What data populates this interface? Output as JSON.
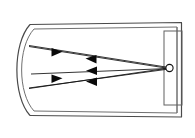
{
  "figure": {
    "title": "",
    "type": "optical-ray-diagram",
    "background_color": "#ffffff",
    "stroke_color": "#555555",
    "ray_color": "#111111",
    "width": 195,
    "height": 138
  },
  "housing": {
    "name": "lamp-housing-outline",
    "outer_path": "M 30 25 L 181 23 L 181 117 L 30 115 L 17 93 L 17 47 Z",
    "inner_path": "M 34 29 L 177 27 L 177 113 L 34 111 L 22 92 L 22 48 Z",
    "description": "Double-line rounded housing enclosure"
  },
  "mirror": {
    "name": "parabolic-reflector",
    "outer_arc": "M 30 25 C 13 45, 13 95, 30 115",
    "inner_arc": "M 34 29 C 18 47, 18 93, 34 111",
    "description": "Curved parabolic reflecting surface on the left"
  },
  "lamp_box": {
    "name": "lamp-socket-rectangle",
    "x": 164,
    "y": 31,
    "width": 18,
    "height": 74,
    "description": "Rectangular lamp socket on the right"
  },
  "source": {
    "name": "light-source-point",
    "cx": 169.5,
    "cy": 68,
    "r": 3.6,
    "description": "Point light source / filament at the focus"
  },
  "rays": [
    {
      "name": "incident-ray-upper",
      "from": [
        169,
        68
      ],
      "to": [
        29,
        46
      ],
      "direction": "left",
      "arrow_at": [
        92,
        58
      ],
      "label": "incident ray to upper mirror"
    },
    {
      "name": "incident-ray-middle",
      "from": [
        169,
        68
      ],
      "to": [
        31,
        74
      ],
      "direction": "left",
      "arrow_at": [
        92,
        70
      ],
      "label": "incident ray to mid mirror"
    },
    {
      "name": "incident-ray-lower",
      "from": [
        169,
        68
      ],
      "to": [
        29,
        88
      ],
      "direction": "left",
      "arrow_at": [
        92,
        80
      ],
      "label": "incident ray to lower mirror"
    },
    {
      "name": "reflected-ray-upper",
      "from": [
        29,
        46
      ],
      "to": [
        169,
        69
      ],
      "direction": "right",
      "arrow_at": [
        58,
        51
      ],
      "label": "reflected ray from upper mirror"
    },
    {
      "name": "reflected-ray-lower",
      "from": [
        29,
        88
      ],
      "to": [
        169,
        68
      ],
      "direction": "right",
      "arrow_at": [
        58,
        78
      ],
      "label": "reflected ray from lower mirror"
    }
  ],
  "arrowheads": [
    {
      "name": "arrowhead-left-upper",
      "x": 92,
      "y": 58,
      "dir": "left"
    },
    {
      "name": "arrowhead-left-middle",
      "x": 92,
      "y": 70,
      "dir": "left"
    },
    {
      "name": "arrowhead-left-lower",
      "x": 92,
      "y": 81,
      "dir": "left"
    },
    {
      "name": "arrowhead-right-upper",
      "x": 58,
      "y": 52,
      "dir": "right"
    },
    {
      "name": "arrowhead-right-lower",
      "x": 58,
      "y": 78,
      "dir": "right"
    }
  ]
}
